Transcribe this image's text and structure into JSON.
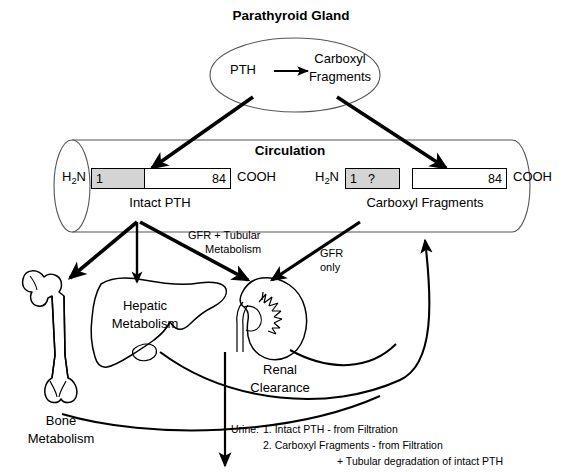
{
  "diagram": {
    "title": "Parathyroid Gland",
    "circulation_label": "Circulation",
    "gland": {
      "source": "PTH",
      "product_line1": "Carboxyl",
      "product_line2": "Fragments"
    },
    "peptides": {
      "intact": {
        "n_terminus": "H",
        "n_sub": "2",
        "n_terminus_tail": "N",
        "start_number": "1",
        "end_number": "84",
        "c_terminus": "COOH",
        "caption": "Intact PTH"
      },
      "fragments": {
        "n_terminus": "H",
        "n_sub": "2",
        "n_terminus_tail": "N",
        "start_number": "1",
        "unknown_marker": "?",
        "end_number": "84",
        "c_terminus": "COOH",
        "caption": "Carboxyl Fragments"
      }
    },
    "pathways": {
      "gfr_tubular_line1": "GFR + Tubular",
      "gfr_tubular_line2": "Metabolism",
      "gfr_only_line1": "GFR",
      "gfr_only_line2": "only"
    },
    "organs": {
      "bone_line1": "Bone",
      "bone_line2": "Metabolism",
      "liver_line1": "Hepatic",
      "liver_line2": "Metabolism",
      "kidney_line1": "Renal",
      "kidney_line2": "Clearance"
    },
    "urine": {
      "prefix": "Urine:",
      "item1": "1.  Intact PTH - from Filtration",
      "item2": "2. Carboxyl Fragments - from Filtration",
      "item3": "+ Tubular degradation of intact PTH"
    },
    "colors": {
      "ink": "#000000",
      "shade": "#d4d4d4",
      "outline": "#555555",
      "background": "#ffffff"
    }
  }
}
